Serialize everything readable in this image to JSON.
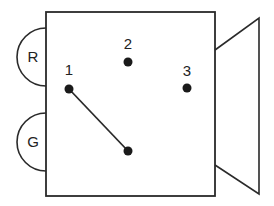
{
  "diagram": {
    "colors": {
      "stroke": "#2a2a2a",
      "background": "#ffffff",
      "dot": "#1a1a1a"
    },
    "box": {
      "x": 46,
      "y": 12,
      "width": 169,
      "height": 184
    },
    "cone": {
      "points": "215,50 259,18 259,194 215,165"
    },
    "side_lobes": [
      {
        "id": "R",
        "label": "R",
        "cy": 57,
        "r": 29
      },
      {
        "id": "G",
        "label": "G",
        "cy": 142,
        "r": 29
      }
    ],
    "points": [
      {
        "id": "1",
        "label": "1",
        "x": 69,
        "y": 89,
        "label_y": 71
      },
      {
        "id": "2",
        "label": "2",
        "x": 128,
        "y": 62,
        "label_y": 45
      },
      {
        "id": "3",
        "label": "3",
        "x": 187,
        "y": 88,
        "label_y": 72
      }
    ],
    "pivot": {
      "x": 128,
      "y": 151
    },
    "lever": {
      "from": "pivot",
      "to": "1"
    }
  }
}
